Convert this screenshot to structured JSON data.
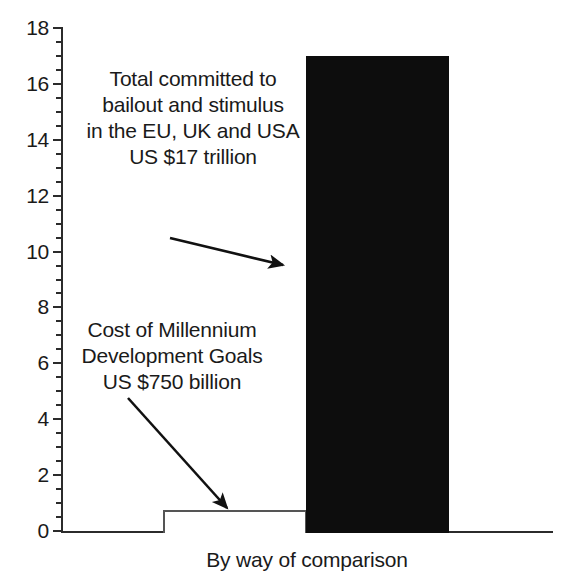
{
  "chart_data": {
    "type": "bar",
    "title": "",
    "xlabel": "By way of comparison",
    "ylabel": "",
    "ylim": [
      0,
      18
    ],
    "ytick_values": [
      0,
      2,
      4,
      6,
      8,
      10,
      12,
      14,
      16,
      18
    ],
    "ytick_labels": [
      "0",
      "2",
      "4",
      "6",
      "8",
      "10",
      "12",
      "14",
      "16",
      "18"
    ],
    "minor_tick_interval": 0.5,
    "grid": false,
    "legend": "none",
    "units": "US $ trillion",
    "categories": [
      "Cost of Millennium Development Goals",
      "Total committed to bailout and stimulus in the EU, UK and USA"
    ],
    "values": [
      0.75,
      17
    ],
    "bar_colors": [
      "#ffffff",
      "#0d0d0d"
    ],
    "bar_edge_colors": [
      "#555555",
      "#0d0d0d"
    ],
    "annotations": [
      {
        "name": "bailout-annotation",
        "text": "Total committed to\nbailout and stimulus\nin the EU, UK and USA\nUS $17 trillion",
        "points_to_value": 17
      },
      {
        "name": "mdg-annotation",
        "text": "Cost of Millennium\nDevelopment Goals\nUS $750 billion",
        "points_to_value": 0.75
      }
    ]
  },
  "axis": {
    "caption": "By way of comparison",
    "tick_labels": [
      "18",
      "16",
      "14",
      "12",
      "10",
      "8",
      "6",
      "4",
      "2",
      "0"
    ]
  },
  "colors": {
    "axis": "#2b2b2b",
    "text": "#1a1a1a",
    "bar_dark": "#0d0d0d",
    "bar_light": "#ffffff",
    "bar_light_edge": "#555555",
    "background": "#ffffff"
  }
}
